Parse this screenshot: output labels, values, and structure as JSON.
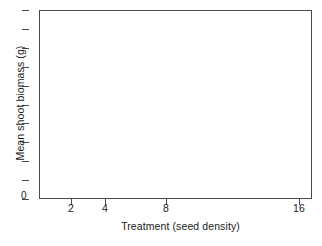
{
  "chart_data": {
    "type": "scatter",
    "title": "",
    "subtitle": "",
    "xlabel": "Treatment (seed density)",
    "ylabel": "Mean shoot biomass (g)",
    "x_scale": "log2",
    "x_tick_labels": [
      "2",
      "4",
      "8",
      "16"
    ],
    "x_tick_values": [
      2,
      4,
      8,
      16
    ],
    "y_tick_labels": [
      "0",
      "",
      "",
      "",
      "",
      "",
      "",
      "",
      "",
      "",
      ""
    ],
    "y_zero_label": "0",
    "y_tick_count": 11,
    "ylim": [
      0,
      10
    ],
    "grid": false,
    "legend": false,
    "legend_entries": [],
    "series": [],
    "values": [],
    "annotations": [],
    "note": "Empty axes template: plot frame drawn with no data points or curves rendered inside."
  },
  "axes": {
    "x": {
      "title": "Treatment (seed density)",
      "ticks": [
        {
          "label": "2",
          "value": 2,
          "px": 71
        },
        {
          "label": "4",
          "value": 4,
          "px": 105
        },
        {
          "label": "8",
          "value": 8,
          "px": 166
        },
        {
          "label": "16",
          "value": 16,
          "px": 299
        }
      ]
    },
    "y": {
      "title": "Mean shoot biomass (g)",
      "zero_label": "0",
      "tick_positions_px": [
        10,
        29,
        48,
        67,
        86,
        105,
        123,
        142,
        161,
        180,
        199
      ]
    }
  },
  "style": {
    "background": "#ffffff",
    "axis_color": "#4a4a4a",
    "text_color": "#1a1a1a"
  }
}
